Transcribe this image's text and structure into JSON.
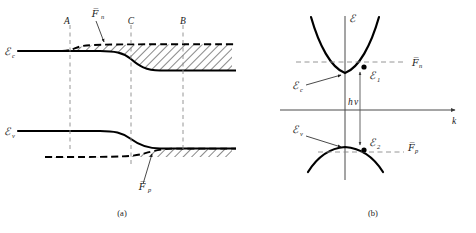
{
  "figure": {
    "captions": {
      "panel_a": "(a)",
      "panel_b": "(b)"
    }
  },
  "panel_a": {
    "name": "real-space-band-diagram",
    "band_labels": {
      "conduction": "ℰ",
      "conduction_sub": "c",
      "valence": "ℰ",
      "valence_sub": "v"
    },
    "quasi_fermi": {
      "electron_symbol": "F̅",
      "electron_sub": "n",
      "hole_symbol": "F̅",
      "hole_sub": "p"
    },
    "position_markers": [
      {
        "label": "A",
        "x": 70
      },
      {
        "label": "C",
        "x": 131
      },
      {
        "label": "B",
        "x": 183
      }
    ],
    "shading": "diagonal-hatch",
    "notes": "Hatched regions indicate filled states between band edge and quasi-Fermi level"
  },
  "panel_b": {
    "name": "energy-momentum-diagram",
    "axis_labels": {
      "vertical": "ℰ",
      "horizontal": "k"
    },
    "band_labels": {
      "conduction": "ℰ",
      "conduction_sub": "c",
      "valence": "ℰ",
      "valence_sub": "v"
    },
    "state_labels": [
      {
        "symbol": "ℰ",
        "sub": "1"
      },
      {
        "symbol": "ℰ",
        "sub": "2"
      }
    ],
    "quasi_fermi": {
      "electron_symbol": "F̅",
      "electron_sub": "n",
      "hole_symbol": "F̅",
      "hole_sub": "p"
    },
    "transition": {
      "label_h": "h",
      "label_nu": "ν"
    }
  },
  "colors": {
    "ink": "#000000",
    "guide": "#8a8a8a",
    "axis": "#4a4a4a",
    "background": "#ffffff"
  }
}
